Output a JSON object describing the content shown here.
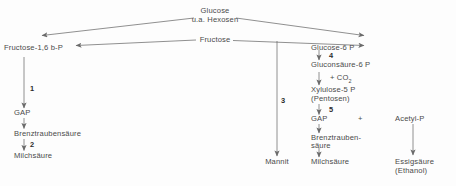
{
  "diagram": {
    "line_color": "#6b6b6b",
    "text_color": "#4a4a4a",
    "number_color": "#2b2b2b",
    "background": "#fdfdfd"
  },
  "nodes": {
    "glucose_line1": "Glucose",
    "glucose_line2": "u.a. Hexosen",
    "fructose": "Fructose",
    "fructose_bp": "Fructose-1,6 b-P",
    "glucose6p": "Glucose-6 P",
    "gluconsaeure6p": "Gluconsäure-6 P",
    "co2": "+ CO",
    "co2_sub": "2",
    "xylulose5p": "Xylulose-5 P",
    "pentosen": "(Pentosen)",
    "gap_left": "GAP",
    "brenztraubensaeure_left": "Brenztraubensäure",
    "milchsaeure_left": "Milchsäure",
    "mannit": "Mannit",
    "gap_right": "GAP",
    "plus_sign": "+",
    "acetyl_p": "Acetyl-P",
    "brenztrauben_right_line1": "Brenztrauben-",
    "brenztrauben_right_line2": "säure",
    "milchsaeure_right": "Milchsäure",
    "essigsaeure": "Essigsäure",
    "ethanol": "(Ethanol)"
  },
  "step_numbers": {
    "one": "1",
    "two": "2",
    "three": "3",
    "four": "4",
    "five": "5"
  }
}
